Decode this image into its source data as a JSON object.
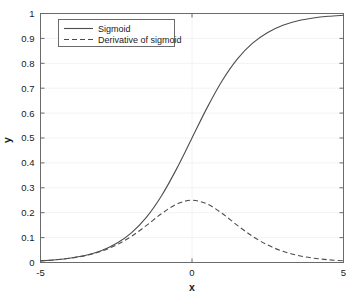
{
  "chart_data": {
    "type": "line",
    "title": "",
    "xlabel": "x",
    "ylabel": "y",
    "xlim": [
      -5,
      5
    ],
    "ylim": [
      0,
      1
    ],
    "grid": true,
    "legend_position": "top-left",
    "xticks": [
      -5,
      0,
      5
    ],
    "xtick_labels": [
      "-5",
      "0",
      "5"
    ],
    "yticks": [
      0,
      0.1,
      0.2,
      0.3,
      0.4,
      0.5,
      0.6,
      0.7,
      0.8,
      0.9,
      1
    ],
    "ytick_labels": [
      "0",
      "0.1",
      "0.2",
      "0.3",
      "0.4",
      "0.5",
      "0.6",
      "0.7",
      "0.8",
      "0.9",
      "1"
    ],
    "series": [
      {
        "name": "Sigmoid",
        "style": "solid",
        "color": "#4d4d4d",
        "x": [
          -5,
          -4.5,
          -4,
          -3.5,
          -3,
          -2.5,
          -2,
          -1.5,
          -1,
          -0.5,
          0,
          0.5,
          1,
          1.5,
          2,
          2.5,
          3,
          3.5,
          4,
          4.5,
          5
        ],
        "values": [
          0.0067,
          0.011,
          0.018,
          0.029,
          0.047,
          0.076,
          0.119,
          0.182,
          0.269,
          0.378,
          0.5,
          0.622,
          0.731,
          0.818,
          0.881,
          0.924,
          0.953,
          0.971,
          0.982,
          0.989,
          0.993
        ]
      },
      {
        "name": "Derivative of sigmoid",
        "style": "dashed",
        "color": "#4d4d4d",
        "x": [
          -5,
          -4.5,
          -4,
          -3.5,
          -3,
          -2.5,
          -2,
          -1.5,
          -1,
          -0.5,
          0,
          0.5,
          1,
          1.5,
          2,
          2.5,
          3,
          3.5,
          4,
          4.5,
          5
        ],
        "values": [
          0.0066,
          0.0109,
          0.0177,
          0.0282,
          0.0452,
          0.0701,
          0.105,
          0.1491,
          0.1966,
          0.235,
          0.25,
          0.235,
          0.1966,
          0.1491,
          0.105,
          0.0701,
          0.0452,
          0.0282,
          0.0177,
          0.0109,
          0.0066
        ]
      }
    ],
    "annotations": {
      "peak_derivative_value": 0.25,
      "peak_derivative_x": 0,
      "sigmoid_midpoint_y": 0.5
    }
  },
  "legend": {
    "entries": [
      {
        "label": "Sigmoid"
      },
      {
        "label": "Derivative of sigmoid"
      }
    ]
  },
  "axes": {
    "x_title": "x",
    "y_title": "y"
  },
  "colors": {
    "line": "#4d4d4d",
    "axis": "#6b6b6b",
    "grid": "#f2f2f2",
    "text": "#1a1a1a",
    "background": "#ffffff"
  }
}
